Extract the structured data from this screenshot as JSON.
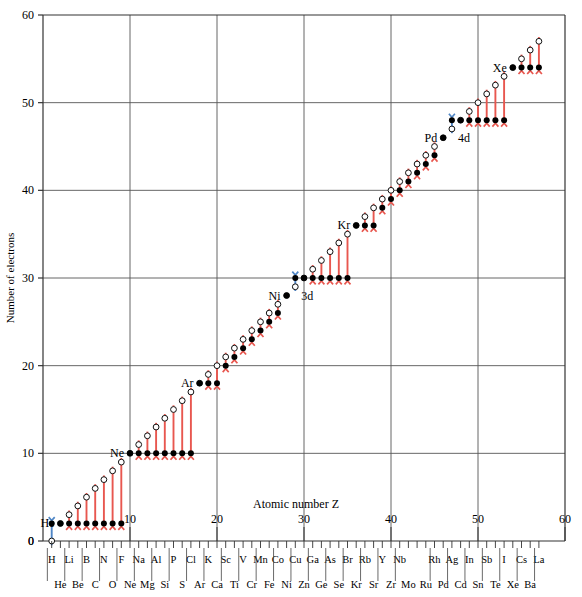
{
  "chart_data": {
    "type": "scatter",
    "title": "",
    "xlabel": "Atomic number Z",
    "ylabel": "Number of electrons",
    "xlim": [
      0,
      60
    ],
    "ylim": [
      0,
      60
    ],
    "xticks": [
      0,
      10,
      20,
      30,
      40,
      50,
      60
    ],
    "yticks": [
      0,
      10,
      20,
      30,
      40,
      50,
      60
    ],
    "grid": true,
    "legend": "none",
    "annotations": [
      {
        "text": "He",
        "x": 2,
        "y": 2,
        "anchor": "right"
      },
      {
        "text": "Ne",
        "x": 10,
        "y": 10,
        "anchor": "right"
      },
      {
        "text": "Ar",
        "x": 18,
        "y": 18,
        "anchor": "right"
      },
      {
        "text": "Ni",
        "x": 28,
        "y": 28,
        "anchor": "right"
      },
      {
        "text": "Kr",
        "x": 36,
        "y": 36,
        "anchor": "right"
      },
      {
        "text": "Pd",
        "x": 46,
        "y": 46,
        "anchor": "right"
      },
      {
        "text": "Xe",
        "x": 54,
        "y": 54,
        "anchor": "right"
      },
      {
        "text": "3d",
        "x": 29,
        "y": 28,
        "anchor": "left"
      },
      {
        "text": "4d",
        "x": 47,
        "y": 46,
        "anchor": "left"
      }
    ],
    "series": [
      {
        "name": "closed-shell level (filled black dot)",
        "marker": "filled-circle",
        "color": "#000000",
        "x": [
          1,
          2,
          3,
          4,
          5,
          6,
          7,
          8,
          9,
          10,
          11,
          12,
          13,
          14,
          15,
          16,
          17,
          18,
          19,
          20,
          21,
          22,
          23,
          24,
          25,
          26,
          27,
          28,
          29,
          30,
          31,
          32,
          33,
          34,
          35,
          36,
          37,
          38,
          39,
          40,
          41,
          42,
          43,
          44,
          45,
          46,
          47,
          48,
          49,
          50,
          51,
          52,
          53,
          54,
          55,
          56,
          57
        ],
        "y": [
          2,
          2,
          2,
          2,
          2,
          2,
          2,
          2,
          2,
          10,
          10,
          10,
          10,
          10,
          10,
          10,
          10,
          18,
          18,
          18,
          20,
          21,
          22,
          23,
          24,
          25,
          26,
          28,
          30,
          30,
          30,
          30,
          30,
          30,
          30,
          36,
          36,
          36,
          38,
          39,
          40,
          41,
          42,
          43,
          44,
          46,
          48,
          48,
          48,
          48,
          48,
          48,
          48,
          54,
          54,
          54,
          54
        ]
      },
      {
        "name": "actual electron number (open circle)",
        "marker": "open-circle",
        "color": "#000000",
        "x": [
          1,
          2,
          3,
          4,
          5,
          6,
          7,
          8,
          9,
          10,
          11,
          12,
          13,
          14,
          15,
          16,
          17,
          18,
          19,
          20,
          21,
          22,
          23,
          24,
          25,
          26,
          27,
          28,
          29,
          30,
          31,
          32,
          33,
          34,
          35,
          36,
          37,
          38,
          39,
          40,
          41,
          42,
          43,
          44,
          45,
          46,
          47,
          48,
          49,
          50,
          51,
          52,
          53,
          54,
          55,
          56,
          57
        ],
        "y": [
          0,
          2,
          3,
          4,
          5,
          6,
          7,
          8,
          9,
          10,
          11,
          12,
          13,
          14,
          15,
          16,
          17,
          18,
          19,
          20,
          21,
          22,
          23,
          24,
          25,
          26,
          27,
          28,
          29,
          30,
          31,
          32,
          33,
          34,
          35,
          36,
          37,
          38,
          39,
          40,
          41,
          42,
          43,
          44,
          45,
          46,
          47,
          48,
          49,
          50,
          51,
          52,
          53,
          54,
          55,
          56,
          57
        ]
      }
    ],
    "arrows": {
      "down_color": "#e8574f",
      "up_color": "#4f86c6",
      "down_label": "open circle above, arrow down to filled dot",
      "up_label": "open circle below, arrow up to filled dot"
    },
    "element_labels_row1": [
      {
        "z": 1,
        "s": "H"
      },
      {
        "z": 3,
        "s": "Li"
      },
      {
        "z": 5,
        "s": "B"
      },
      {
        "z": 7,
        "s": "N"
      },
      {
        "z": 9,
        "s": "F"
      },
      {
        "z": 11,
        "s": "Na"
      },
      {
        "z": 13,
        "s": "Al"
      },
      {
        "z": 15,
        "s": "P"
      },
      {
        "z": 17,
        "s": "Cl"
      },
      {
        "z": 19,
        "s": "K"
      },
      {
        "z": 21,
        "s": "Sc"
      },
      {
        "z": 23,
        "s": "V"
      },
      {
        "z": 25,
        "s": "Mn"
      },
      {
        "z": 27,
        "s": "Co"
      },
      {
        "z": 29,
        "s": "Cu"
      },
      {
        "z": 31,
        "s": "Ga"
      },
      {
        "z": 33,
        "s": "As"
      },
      {
        "z": 35,
        "s": "Br"
      },
      {
        "z": 37,
        "s": "Rb"
      },
      {
        "z": 39,
        "s": "Y"
      },
      {
        "z": 41,
        "s": "Nb"
      },
      {
        "z": 45,
        "s": "Rh"
      },
      {
        "z": 47,
        "s": "Ag"
      },
      {
        "z": 49,
        "s": "In"
      },
      {
        "z": 51,
        "s": "Sb"
      },
      {
        "z": 53,
        "s": "I"
      },
      {
        "z": 55,
        "s": "Cs"
      },
      {
        "z": 57,
        "s": "La"
      }
    ],
    "element_labels_row2": [
      {
        "z": 2,
        "s": "He"
      },
      {
        "z": 4,
        "s": "Be"
      },
      {
        "z": 6,
        "s": "C"
      },
      {
        "z": 8,
        "s": "O"
      },
      {
        "z": 10,
        "s": "Ne"
      },
      {
        "z": 12,
        "s": "Mg"
      },
      {
        "z": 14,
        "s": "Si"
      },
      {
        "z": 16,
        "s": "S"
      },
      {
        "z": 18,
        "s": "Ar"
      },
      {
        "z": 20,
        "s": "Ca"
      },
      {
        "z": 22,
        "s": "Ti"
      },
      {
        "z": 24,
        "s": "Cr"
      },
      {
        "z": 26,
        "s": "Fe"
      },
      {
        "z": 28,
        "s": "Ni"
      },
      {
        "z": 30,
        "s": "Zn"
      },
      {
        "z": 32,
        "s": "Ge"
      },
      {
        "z": 34,
        "s": "Se"
      },
      {
        "z": 36,
        "s": "Kr"
      },
      {
        "z": 38,
        "s": "Sr"
      },
      {
        "z": 40,
        "s": "Zr"
      },
      {
        "z": 42,
        "s": "Mo"
      },
      {
        "z": 44,
        "s": "Ru"
      },
      {
        "z": 46,
        "s": "Pd"
      },
      {
        "z": 48,
        "s": "Cd"
      },
      {
        "z": 50,
        "s": "Sn"
      },
      {
        "z": 52,
        "s": "Te"
      },
      {
        "z": 54,
        "s": "Xe"
      },
      {
        "z": 56,
        "s": "Ba"
      }
    ]
  },
  "figure": {
    "ylabel": "Number of electrons",
    "xlabel": "Atomic number Z"
  }
}
